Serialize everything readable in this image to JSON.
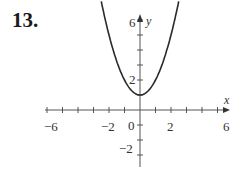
{
  "problem_number": "13.",
  "chart_data": {
    "type": "line",
    "title": "",
    "function": "y = x^2 + 1",
    "series": [
      {
        "name": "parabola",
        "x": [
          -2.24,
          -2,
          -1.5,
          -1,
          -0.5,
          0,
          0.5,
          1,
          1.5,
          2,
          2.24
        ],
        "y": [
          6,
          5,
          3.25,
          2,
          1.25,
          1,
          1.25,
          2,
          3.25,
          5,
          6
        ]
      }
    ],
    "xlabel": "x",
    "ylabel": "y",
    "x_ticks_labeled": [
      "-6",
      "-2",
      "0",
      "2",
      "6"
    ],
    "y_ticks_labeled": [
      "6",
      "2",
      "-2"
    ],
    "xlim": [
      -6,
      6
    ],
    "ylim": [
      -3,
      6.5
    ],
    "grid": false
  },
  "labels": {
    "x_axis": "x",
    "y_axis": "y",
    "xm6": "−6",
    "xm2": "−2",
    "x0": "0",
    "x2": "2",
    "x6": "6",
    "y6": "6",
    "y2": "2",
    "ym2": "−2"
  },
  "colors": {
    "curve": "#2a2a2a",
    "axis": "#555555"
  }
}
